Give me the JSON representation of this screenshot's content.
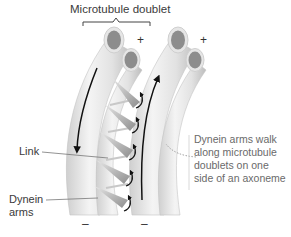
{
  "title": "Microtubule doublet",
  "labels": {
    "link": "Link",
    "dynein_line1": "Dynein",
    "dynein_line2": "arms"
  },
  "annotation": {
    "line1": "Dynein arms walk",
    "line2": "along microtubule",
    "line3": "doublets on one",
    "line4": "side of an axoneme"
  },
  "polarity": {
    "left_top": "+",
    "right_top": "+",
    "left_bottom": "–",
    "right_bottom": "–"
  },
  "colors": {
    "tube_light": "#f2f2f2",
    "tube_mid": "#d6d6d6",
    "tube_dark": "#b8b8b8",
    "lumen": "#8a8a8a",
    "arrow": "#111111",
    "leader": "#888888"
  }
}
